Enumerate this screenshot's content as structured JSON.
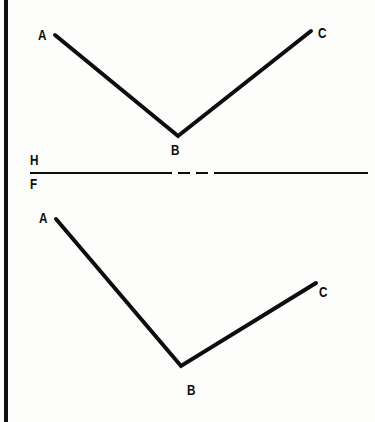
{
  "figure": {
    "type": "orthographic-projection-drawing",
    "background_color": "#fdfdfc",
    "ink_color": "#0d0d0d",
    "canvas": {
      "width": 375,
      "height": 422
    },
    "scan_edge": {
      "x": 4,
      "width": 4,
      "color": "#111111"
    }
  },
  "reference_line": {
    "name": "fold-line",
    "y": 173,
    "x_start": 30,
    "x_end": 368,
    "thickness": 2,
    "segments": [
      {
        "x1": 30,
        "x2": 172,
        "style": "solid"
      },
      {
        "x1": 178,
        "x2": 190,
        "style": "dash"
      },
      {
        "x1": 196,
        "x2": 208,
        "style": "dash"
      },
      {
        "x1": 214,
        "x2": 368,
        "style": "solid"
      }
    ],
    "upper_label": "H",
    "lower_label": "F",
    "upper_label_pos": {
      "x": 30,
      "y": 152
    },
    "lower_label_pos": {
      "x": 30,
      "y": 176
    }
  },
  "views": [
    {
      "id": "top-view",
      "name": "horizontal-view",
      "stroke_width": 4,
      "polyline": [
        {
          "point": "A",
          "x": 55,
          "y": 35
        },
        {
          "point": "B",
          "x": 178,
          "y": 136
        },
        {
          "point": "C",
          "x": 311,
          "y": 31
        }
      ],
      "labels": [
        {
          "text": "A",
          "x": 38,
          "y": 27
        },
        {
          "text": "B",
          "x": 171,
          "y": 142
        },
        {
          "text": "C",
          "x": 318,
          "y": 25
        }
      ]
    },
    {
      "id": "front-view",
      "name": "frontal-view",
      "stroke_width": 4,
      "polyline": [
        {
          "point": "A",
          "x": 56,
          "y": 219
        },
        {
          "point": "B",
          "x": 181,
          "y": 366
        },
        {
          "point": "C",
          "x": 316,
          "y": 283
        }
      ],
      "labels": [
        {
          "text": "A",
          "x": 39,
          "y": 210
        },
        {
          "text": "B",
          "x": 187,
          "y": 382
        },
        {
          "text": "C",
          "x": 319,
          "y": 284
        }
      ]
    }
  ]
}
